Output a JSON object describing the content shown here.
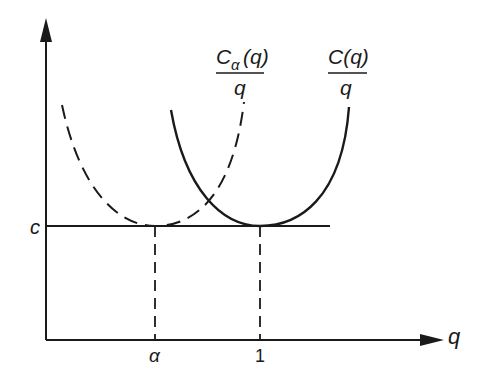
{
  "diagram": {
    "axes": {
      "y_label": "c",
      "x_label": "q",
      "x_ticks": [
        "α",
        "1"
      ]
    },
    "curves": [
      {
        "name": "C_alpha(q)/q",
        "numerator": "C",
        "subscript": "α",
        "argument": "(q)",
        "denominator": "q",
        "style": "dashed"
      },
      {
        "name": "C(q)/q",
        "numerator": "C(q)",
        "denominator": "q",
        "style": "solid"
      }
    ],
    "colors": {
      "ink": "#1a1a1a",
      "background": "#ffffff"
    }
  }
}
